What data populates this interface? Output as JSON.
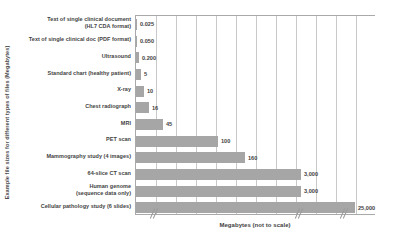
{
  "chart_data": {
    "type": "bar",
    "orientation": "horizontal",
    "title": "",
    "xlabel": "Megabytes (not to scale)",
    "ylabel": "Example file sizes for different types of files (Megabytes)",
    "grid": true,
    "legend": null,
    "note": "x axis is broken / not to scale",
    "categories": [
      "Text of single clinical document (HL7 CDA format)",
      "Text of single clinical doc (PDF format)",
      "Ultrasound",
      "Standard chart (healthy patient)",
      "X-ray",
      "Chest radiograph",
      "MRI",
      "PET scan",
      "Mammography study (4 images)",
      "64-slice CT scan",
      "Human genome (sequence data only)",
      "Cellular pathology study (6 slides)"
    ],
    "category_lines": [
      [
        "Text of single clinical document",
        "(HL7 CDA format)"
      ],
      [
        "Text of single clinical doc (PDF format)"
      ],
      [
        "Ultrasound"
      ],
      [
        "Standard chart (healthy patient)"
      ],
      [
        "X-ray"
      ],
      [
        "Chest radiograph"
      ],
      [
        "MRI"
      ],
      [
        "PET scan"
      ],
      [
        "Mammography study (4 images)"
      ],
      [
        "64-slice CT scan"
      ],
      [
        "Human genome",
        "(sequence data only)"
      ],
      [
        "Cellular pathology study (6 slides)"
      ]
    ],
    "values": [
      0.025,
      0.05,
      0.2,
      5,
      10,
      16,
      45,
      100,
      160,
      3000,
      3000,
      25000
    ],
    "value_labels": [
      "0.025",
      "0.050",
      "0.200",
      "5",
      "10",
      "16",
      "45",
      "100",
      "160",
      "3,000",
      "3,000",
      "25,000"
    ],
    "bar_pixel_widths": [
      1,
      1,
      3,
      5,
      8,
      13,
      27,
      82,
      109,
      165,
      165,
      219
    ],
    "bar_color": "#a6a6a6",
    "gridline_color": "#c9c9c9",
    "axis_color": "#a9a9a9",
    "text_color": "#3f3f3f",
    "background": "#ffffff",
    "gridline_count": 11
  }
}
